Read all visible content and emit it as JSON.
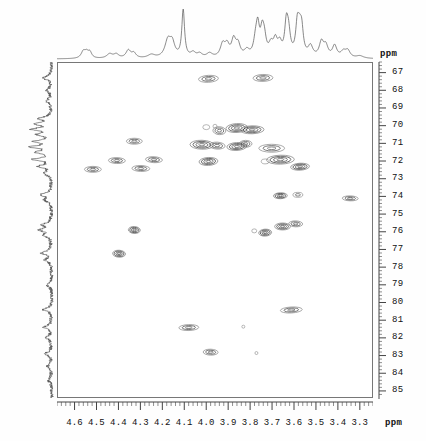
{
  "axes": {
    "x_unit": "ppm",
    "y_unit": "ppm",
    "x_labels": [
      "4.6",
      "4.5",
      "4.4",
      "4.3",
      "4.2",
      "4.1",
      "4.0",
      "3.9",
      "3.8",
      "3.7",
      "3.6",
      "3.5",
      "3.4",
      "3.3"
    ],
    "y_labels": [
      "67",
      "68",
      "69",
      "70",
      "71",
      "72",
      "73",
      "74",
      "75",
      "76",
      "77",
      "78",
      "79",
      "80",
      "81",
      "82",
      "83",
      "84",
      "85"
    ]
  },
  "chart_data": {
    "type": "scatter",
    "xlabel": "ppm",
    "ylabel": "ppm",
    "xlim": [
      4.68,
      3.24
    ],
    "ylim": [
      66.4,
      85.4
    ],
    "x_reversed": true,
    "y_reversed": true,
    "grid": false,
    "legend": "none",
    "x_ticks": [
      4.6,
      4.5,
      4.4,
      4.3,
      4.2,
      4.1,
      4.0,
      3.9,
      3.8,
      3.7,
      3.6,
      3.5,
      3.4,
      3.3
    ],
    "y_ticks": [
      67,
      68,
      69,
      70,
      71,
      72,
      73,
      74,
      75,
      76,
      77,
      78,
      79,
      80,
      81,
      82,
      83,
      84,
      85
    ],
    "peaks": [
      {
        "x": 3.99,
        "y": 67.3,
        "w": 20,
        "h": 7,
        "i": 3
      },
      {
        "x": 3.74,
        "y": 67.25,
        "w": 20,
        "h": 7,
        "i": 3
      },
      {
        "x": 4.0,
        "y": 70.05,
        "w": 7,
        "h": 5,
        "i": 1
      },
      {
        "x": 3.96,
        "y": 70.0,
        "w": 4,
        "h": 4,
        "i": 1
      },
      {
        "x": 3.94,
        "y": 70.25,
        "w": 13,
        "h": 8,
        "i": 3
      },
      {
        "x": 3.86,
        "y": 70.1,
        "w": 22,
        "h": 9,
        "i": 4
      },
      {
        "x": 3.79,
        "y": 70.2,
        "w": 24,
        "h": 8,
        "i": 4
      },
      {
        "x": 4.33,
        "y": 70.85,
        "w": 16,
        "h": 6,
        "i": 3
      },
      {
        "x": 4.02,
        "y": 71.05,
        "w": 24,
        "h": 9,
        "i": 4
      },
      {
        "x": 3.95,
        "y": 71.1,
        "w": 16,
        "h": 7,
        "i": 3
      },
      {
        "x": 3.86,
        "y": 71.15,
        "w": 20,
        "h": 8,
        "i": 4
      },
      {
        "x": 3.82,
        "y": 71.0,
        "w": 13,
        "h": 7,
        "i": 3
      },
      {
        "x": 3.7,
        "y": 71.25,
        "w": 26,
        "h": 8,
        "i": 3
      },
      {
        "x": 4.41,
        "y": 71.95,
        "w": 17,
        "h": 6,
        "i": 3
      },
      {
        "x": 4.24,
        "y": 71.9,
        "w": 17,
        "h": 6,
        "i": 3
      },
      {
        "x": 3.99,
        "y": 72.0,
        "w": 19,
        "h": 8,
        "i": 4
      },
      {
        "x": 3.66,
        "y": 71.9,
        "w": 28,
        "h": 9,
        "i": 4
      },
      {
        "x": 4.52,
        "y": 72.45,
        "w": 17,
        "h": 6,
        "i": 3
      },
      {
        "x": 4.3,
        "y": 72.4,
        "w": 18,
        "h": 6,
        "i": 3
      },
      {
        "x": 3.73,
        "y": 72.0,
        "w": 8,
        "h": 5,
        "i": 1
      },
      {
        "x": 3.57,
        "y": 72.3,
        "w": 19,
        "h": 7,
        "i": 4
      },
      {
        "x": 3.66,
        "y": 73.95,
        "w": 14,
        "h": 6,
        "i": 4
      },
      {
        "x": 3.58,
        "y": 73.9,
        "w": 10,
        "h": 5,
        "i": 2
      },
      {
        "x": 3.34,
        "y": 74.1,
        "w": 16,
        "h": 5,
        "i": 3
      },
      {
        "x": 4.33,
        "y": 75.9,
        "w": 12,
        "h": 7,
        "i": 4
      },
      {
        "x": 3.73,
        "y": 76.05,
        "w": 13,
        "h": 7,
        "i": 4
      },
      {
        "x": 3.78,
        "y": 75.95,
        "w": 5,
        "h": 4,
        "i": 1
      },
      {
        "x": 3.65,
        "y": 75.7,
        "w": 16,
        "h": 7,
        "i": 4
      },
      {
        "x": 3.59,
        "y": 75.55,
        "w": 14,
        "h": 6,
        "i": 3
      },
      {
        "x": 4.4,
        "y": 77.25,
        "w": 13,
        "h": 7,
        "i": 4
      },
      {
        "x": 3.61,
        "y": 80.45,
        "w": 22,
        "h": 6,
        "i": 3
      },
      {
        "x": 4.08,
        "y": 81.45,
        "w": 20,
        "h": 6,
        "i": 3
      },
      {
        "x": 3.83,
        "y": 81.4,
        "w": 3,
        "h": 3,
        "i": 1
      },
      {
        "x": 3.98,
        "y": 82.85,
        "w": 15,
        "h": 6,
        "i": 3
      },
      {
        "x": 3.77,
        "y": 82.9,
        "w": 3,
        "h": 3,
        "i": 1
      }
    ],
    "top_projection": {
      "label": "1H projection",
      "description": "1D proton trace across the 4.6-3.3 ppm range with a dominant sharp singlet near 4.10 ppm"
    },
    "left_projection": {
      "label": "13C projection",
      "description": "noisy 1D carbon trace across the 67-85 ppm range"
    }
  }
}
